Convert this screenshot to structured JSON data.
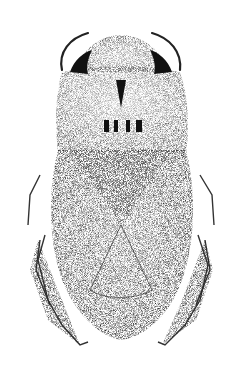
{
  "image": {
    "subject": "stipple illustration of an aquatic insect (dorsal view)",
    "background_color": "#ffffff",
    "ink_color": "#1a1a1a",
    "regions": [
      "head",
      "antennae",
      "pronotum",
      "scutellum",
      "hemelytra",
      "membrane",
      "front-legs",
      "hind-legs"
    ]
  }
}
